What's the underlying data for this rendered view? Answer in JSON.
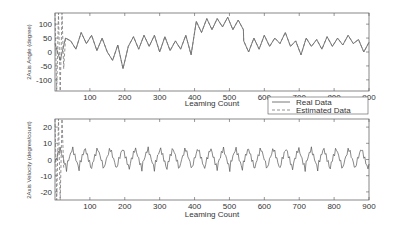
{
  "chart_data": [
    {
      "type": "line",
      "title": "",
      "xlabel": "Leaming Count",
      "ylabel": "2Axis Angle (degree)",
      "xlim": [
        0,
        900
      ],
      "ylim": [
        -140,
        140
      ],
      "xticks": [
        100,
        200,
        300,
        400,
        500,
        600,
        700,
        800,
        900
      ],
      "yticks": [
        100,
        50,
        0,
        -50,
        -100
      ],
      "grid": false,
      "series": [
        {
          "name": "Real Data",
          "style": "solid"
        },
        {
          "name": "Estimated Data",
          "style": "dashed"
        }
      ],
      "x": [
        0,
        15,
        30,
        45,
        60,
        75,
        90,
        105,
        120,
        135,
        150,
        165,
        180,
        195,
        210,
        225,
        240,
        255,
        270,
        285,
        300,
        315,
        330,
        345,
        360,
        375,
        390,
        405,
        420,
        435,
        450,
        465,
        480,
        495,
        510,
        525,
        540,
        541,
        555,
        570,
        585,
        600,
        615,
        630,
        645,
        660,
        675,
        690,
        705,
        720,
        735,
        750,
        765,
        780,
        795,
        810,
        825,
        840,
        855,
        870,
        885,
        900
      ],
      "values": [
        30,
        -30,
        50,
        40,
        10,
        70,
        30,
        60,
        5,
        50,
        0,
        -30,
        25,
        -60,
        20,
        55,
        10,
        60,
        20,
        60,
        0,
        55,
        5,
        40,
        10,
        60,
        -10,
        110,
        70,
        120,
        80,
        120,
        90,
        125,
        80,
        115,
        80,
        40,
        0,
        50,
        10,
        60,
        20,
        50,
        30,
        70,
        20,
        40,
        -10,
        50,
        20,
        45,
        10,
        55,
        20,
        50,
        25,
        60,
        30,
        45,
        0,
        35
      ],
      "estimated_start": [
        0,
        5,
        10,
        15,
        20,
        25
      ],
      "estimated_start_values": [
        140,
        -140,
        140,
        -140,
        140,
        -60
      ]
    },
    {
      "type": "line",
      "title": "",
      "xlabel": "Leaming Count",
      "ylabel": "2Axis Velocity (degree/count)",
      "xlim": [
        0,
        900
      ],
      "ylim": [
        -25,
        25
      ],
      "xticks": [
        100,
        200,
        300,
        400,
        500,
        600,
        700,
        800,
        900
      ],
      "yticks": [
        20,
        10,
        0,
        -10,
        -20
      ],
      "grid": false,
      "series": [
        {
          "name": "Real Data",
          "style": "solid"
        },
        {
          "name": "Estimated Data",
          "style": "dashed"
        }
      ],
      "period": 36,
      "amplitude_peak": 8,
      "amplitude_trough": -8,
      "estimated_start": [
        0,
        5,
        10,
        15,
        20,
        25
      ],
      "estimated_start_values": [
        25,
        -25,
        25,
        -25,
        25,
        -5
      ]
    }
  ],
  "legend": {
    "items": [
      {
        "label": "Real Data",
        "style": "solid"
      },
      {
        "label": "Estimated Data",
        "style": "dashed"
      }
    ]
  },
  "labels": {
    "top_ylabel": "2Axis Angle (degree)",
    "bottom_ylabel": "2Axis Velocity (degree/count)",
    "xlabel": "Leaming Count",
    "xticks": [
      "100",
      "200",
      "300",
      "400",
      "500",
      "600",
      "700",
      "800",
      "900"
    ],
    "top_yticks": [
      "100",
      "50",
      "0",
      "-50",
      "-100"
    ],
    "bottom_yticks": [
      "20",
      "10",
      "0",
      "-10",
      "-20"
    ]
  }
}
